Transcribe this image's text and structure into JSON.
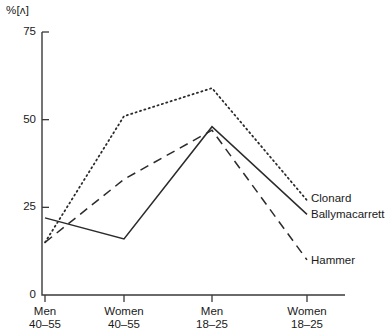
{
  "chart_data": {
    "type": "line",
    "title": "",
    "subtitle": "",
    "xlabel": "",
    "ylabel": "%[ʌ]",
    "ylim": [
      0,
      75
    ],
    "yticks": [
      0,
      25,
      50,
      75
    ],
    "ytick_labels": [
      "0",
      "25",
      "50",
      "75"
    ],
    "grid": false,
    "legend_position": "right-inline-end-of-line",
    "categories": [
      "Men 40-55",
      "Women 40-55",
      "Men 18-25",
      "Women 18-25"
    ],
    "category_lines": [
      [
        "Men",
        "40–55"
      ],
      [
        "Women",
        "40–55"
      ],
      [
        "Men",
        "18–25"
      ],
      [
        "Women",
        "18–25"
      ]
    ],
    "series": [
      {
        "name": "Clonard",
        "style": "dotted",
        "color": "#2b2b2b",
        "values": [
          15,
          51,
          59,
          27
        ]
      },
      {
        "name": "Ballymacarrett",
        "style": "solid",
        "color": "#2b2b2b",
        "values": [
          22,
          16,
          48,
          23
        ]
      },
      {
        "name": "Hammer",
        "style": "dashed",
        "color": "#2b2b2b",
        "values": [
          15,
          33,
          47,
          10
        ]
      }
    ]
  },
  "axis": {
    "unit_label": "%[ʌ]",
    "y_tick_75": "75",
    "y_tick_50": "50",
    "y_tick_25": "25",
    "y_tick_0": "0"
  },
  "x_labels": {
    "c0_top": "Men",
    "c0_bottom": "40–55",
    "c1_top": "Women",
    "c1_bottom": "40–55",
    "c2_top": "Men",
    "c2_bottom": "18–25",
    "c3_top": "Women",
    "c3_bottom": "18–25"
  },
  "legend": {
    "clonard": "Clonard",
    "ballymacarrett": "Ballymacarrett",
    "hammer": "Hammer"
  }
}
